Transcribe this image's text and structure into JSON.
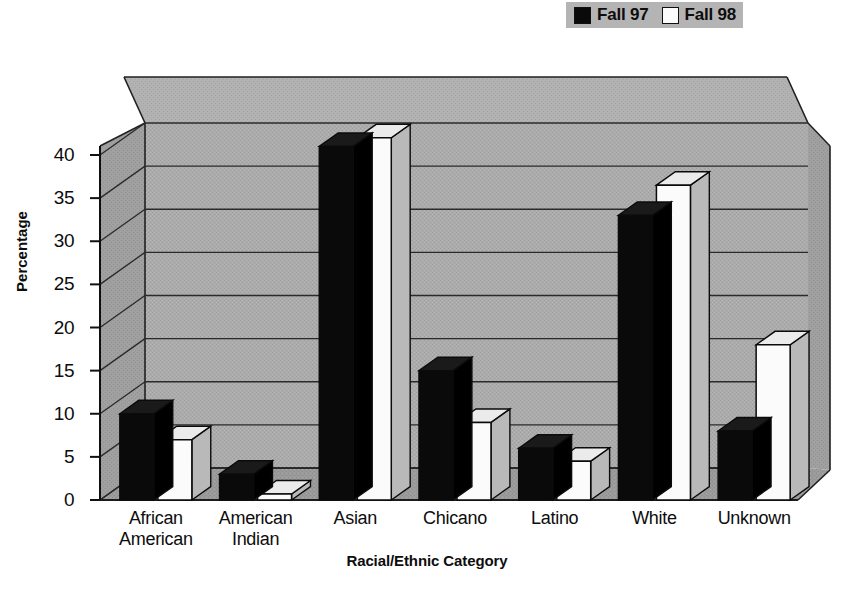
{
  "chart_data": {
    "type": "bar",
    "title": "",
    "xlabel": "Racial/Ethnic Category",
    "ylabel": "Percentage",
    "categories": [
      "African\nAmerican",
      "American\nIndian",
      "Asian",
      "Chicano",
      "Latino",
      "White",
      "Unknown"
    ],
    "series": [
      {
        "name": "Fall 97",
        "color": "#0a0a0a",
        "values": [
          10,
          3,
          41,
          15,
          6,
          33,
          8
        ]
      },
      {
        "name": "Fall 98",
        "color": "#fbfbfb",
        "values": [
          7,
          0.7,
          42,
          9,
          4.5,
          36.5,
          18
        ]
      }
    ],
    "ylim": [
      0,
      40
    ],
    "yticks": [
      0,
      5,
      10,
      15,
      20,
      25,
      30,
      35,
      40
    ],
    "ytick_labels": [
      "0",
      "5",
      "10",
      "15",
      "20",
      "25",
      "30",
      "35",
      "40"
    ],
    "grid": true,
    "legend_position": "top-right",
    "style": "3d-perspective"
  },
  "legend": {
    "entries": [
      {
        "label": "Fall 97",
        "swatch": "filled"
      },
      {
        "label": "Fall 98",
        "swatch": "hollow"
      }
    ]
  },
  "colors": {
    "page_background": "#ffffff",
    "plot_wall": "#a9a9a9",
    "plot_wall_top": "#b0b0b0",
    "floor": "#9a9a9a",
    "side_wall": "#9f9f9f",
    "gridline": "#2a2a2a",
    "axis": "#111111",
    "bar_fall97": "#0a0a0a",
    "bar_fall98": "#fbfbfb",
    "bar_side_dark": "#000000",
    "bar_side_light": "#cfcfcf",
    "legend_background": "#b4b4b4",
    "text": "#0d0d0d"
  }
}
